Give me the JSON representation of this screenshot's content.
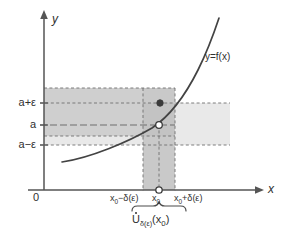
{
  "figure": {
    "title_label": "",
    "axes": {
      "x_axis_label": "x",
      "y_axis_label": "y",
      "origin_label": "0"
    },
    "curve": {
      "label": "y=f(x)"
    },
    "y_ticks": [
      {
        "id": "a-plus-eps",
        "label": "a+ε"
      },
      {
        "id": "a",
        "label": "a"
      },
      {
        "id": "a-minus-eps",
        "label": "a−ε"
      }
    ],
    "x_ticks": [
      {
        "id": "x0-minus-delta",
        "label_main": "x",
        "label_sub": "0",
        "label_rest": "−δ(ε)"
      },
      {
        "id": "x0",
        "label_main": "x",
        "label_sub": "0",
        "label_rest": ""
      },
      {
        "id": "x0-plus-delta",
        "label_main": "x",
        "label_sub": "0",
        "label_rest": "+δ(ε)"
      }
    ],
    "brace": {
      "symbol": "U",
      "subscript": "δ(ε)",
      "argument": "(x",
      "argument_sub": "0",
      "argument_close": ")"
    },
    "points": [
      {
        "id": "point-on-curve-filled",
        "kind": "filled"
      },
      {
        "id": "limit-point-open",
        "kind": "open"
      },
      {
        "id": "x0-axis-open",
        "kind": "open"
      }
    ],
    "colors": {
      "band_dark": "#c8c8c8",
      "band_light": "#e8e8e8",
      "axis": "#555555",
      "curve": "#444444",
      "dashed": "#777777",
      "text": "#303030"
    }
  }
}
